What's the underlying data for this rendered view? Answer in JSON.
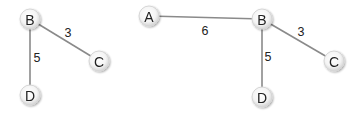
{
  "graphs": [
    {
      "name": "left-graph",
      "nodes": [
        {
          "id": "B",
          "label": "B",
          "x": 30,
          "y": 19
        },
        {
          "id": "C",
          "label": "C",
          "x": 99,
          "y": 61
        },
        {
          "id": "D",
          "label": "D",
          "x": 30,
          "y": 95
        }
      ],
      "edges": [
        {
          "from": "B",
          "to": "C",
          "weight": "3",
          "label_x": 68,
          "label_y": 33
        },
        {
          "from": "B",
          "to": "D",
          "weight": "5",
          "label_x": 37,
          "label_y": 58
        }
      ]
    },
    {
      "name": "right-graph",
      "nodes": [
        {
          "id": "A",
          "label": "A",
          "x": 149,
          "y": 16
        },
        {
          "id": "B",
          "label": "B",
          "x": 262,
          "y": 19
        },
        {
          "id": "C",
          "label": "C",
          "x": 334,
          "y": 61
        },
        {
          "id": "D",
          "label": "D",
          "x": 262,
          "y": 97
        }
      ],
      "edges": [
        {
          "from": "A",
          "to": "B",
          "weight": "6",
          "label_x": 205,
          "label_y": 31
        },
        {
          "from": "B",
          "to": "C",
          "weight": "3",
          "label_x": 301,
          "label_y": 32
        },
        {
          "from": "B",
          "to": "D",
          "weight": "5",
          "label_x": 268,
          "label_y": 57
        }
      ]
    }
  ],
  "style": {
    "edge_color": "#8a8a8a",
    "node_fill_center": "#ffffff",
    "node_fill_edge": "#d9d9d9",
    "node_radius": 10
  }
}
